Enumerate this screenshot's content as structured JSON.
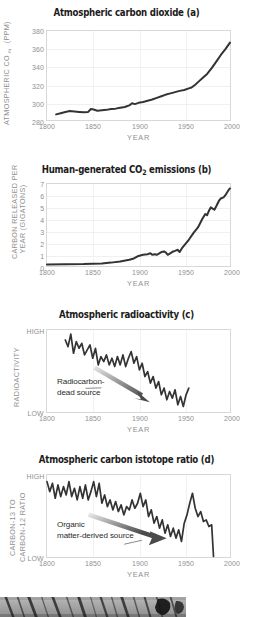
{
  "figure": {
    "xlabel": "YEAR",
    "xticks": [
      "1800",
      "1850",
      "1900",
      "1950",
      "2000"
    ]
  },
  "panels": {
    "a": {
      "title_prefix": "Atmospheric carbon dioxide",
      "title": "Atmospheric carbon dioxide (a)",
      "panel_letter": "(a)",
      "ylabel": "ATMOSPHERIC CO",
      "ylabel_sub": "2",
      "ylabel_suffix": " (PPM)",
      "ylabel_full": "ATMOSPHERIC CO2 (PPM)",
      "yticks": [
        "380",
        "360",
        "340",
        "320",
        "300",
        "280"
      ]
    },
    "b": {
      "title": "Human-generated CO2 emissions (b)",
      "title_part1": "Human-generated CO",
      "title_sub": "2",
      "title_part2": " emissions (b)",
      "panel_letter": "(b)",
      "ylabel_line1": "CARBON RELEASED PER",
      "ylabel_line2": "YEAR (GIGATONS)",
      "yticks": [
        "7",
        "6",
        "5",
        "4",
        "3",
        "2",
        "1",
        "0"
      ]
    },
    "c": {
      "title": "Atmospheric radioactivity (c)",
      "panel_letter": "(c)",
      "ylabel": "RADIOACTIVITY",
      "ytick_high": "HIGH",
      "ytick_low": "LOW",
      "annotation_line1": "Radiocarbon-",
      "annotation_line2": "dead source"
    },
    "d": {
      "title": "Atmospheric carbon istotope ratio (d)",
      "panel_letter": "(d)",
      "ylabel_line1": "CARBON-13 TO",
      "ylabel_line2": "CARBON-12 RATIO",
      "ytick_high": "HIGH",
      "ytick_low": "LOW",
      "annotation_line1": "Organic",
      "annotation_line2": "matter-derived source"
    }
  },
  "colors": {
    "series": "#333333",
    "title": "#1b1b1b",
    "tick": "#8f8f8f",
    "frame": "#d8d8d8",
    "grid": "#f0f0f0",
    "annotation": "#2b2b2b",
    "arrow_dark": "#4a4a4a",
    "arrow_light": "#dddddd"
  },
  "chart_data": [
    {
      "type": "line",
      "id": "a",
      "title": "Atmospheric carbon dioxide (a)",
      "xlabel": "YEAR",
      "ylabel": "ATMOSPHERIC CO2 (PPM)",
      "xlim": [
        1800,
        2000
      ],
      "ylim": [
        273,
        382
      ],
      "yticks": [
        280,
        300,
        320,
        340,
        360,
        380
      ],
      "xticks": [
        1800,
        1850,
        1900,
        1950,
        2000
      ],
      "grid": true,
      "x": [
        1810,
        1815,
        1820,
        1825,
        1830,
        1835,
        1840,
        1845,
        1848,
        1851,
        1855,
        1860,
        1865,
        1870,
        1875,
        1880,
        1885,
        1890,
        1893,
        1896,
        1900,
        1905,
        1910,
        1915,
        1920,
        1925,
        1930,
        1935,
        1940,
        1945,
        1950,
        1955,
        1958,
        1962,
        1966,
        1970,
        1975,
        1980,
        1985,
        1990,
        1995,
        2000
      ],
      "values": [
        281,
        282.5,
        284,
        285,
        284.5,
        284,
        283.5,
        284,
        287.5,
        287,
        285.5,
        286,
        286.5,
        287.5,
        288,
        289,
        290,
        292,
        294.5,
        293.5,
        295,
        296,
        297.5,
        299,
        301,
        303,
        305,
        306.5,
        308,
        309.5,
        310.5,
        312.5,
        313.5,
        317,
        321,
        325,
        330,
        337,
        345,
        353,
        360,
        368
      ]
    },
    {
      "type": "line",
      "id": "b",
      "title": "Human-generated CO2 emissions (b)",
      "xlabel": "YEAR",
      "ylabel": "CARBON RELEASED PER YEAR (GIGATONS)",
      "xlim": [
        1800,
        2000
      ],
      "ylim": [
        -0.15,
        7.3
      ],
      "yticks": [
        0,
        1,
        2,
        3,
        4,
        5,
        6,
        7
      ],
      "xticks": [
        1800,
        1850,
        1900,
        1950,
        2000
      ],
      "grid": true,
      "x": [
        1800,
        1820,
        1840,
        1860,
        1870,
        1880,
        1890,
        1895,
        1900,
        1905,
        1910,
        1913,
        1915,
        1918,
        1920,
        1925,
        1928,
        1930,
        1932,
        1935,
        1938,
        1940,
        1943,
        1945,
        1948,
        1950,
        1955,
        1960,
        1965,
        1970,
        1973,
        1975,
        1977,
        1979,
        1981,
        1983,
        1985,
        1988,
        1990,
        1993,
        1995,
        1998,
        2000
      ],
      "values": [
        0.08,
        0.1,
        0.12,
        0.18,
        0.25,
        0.35,
        0.5,
        0.62,
        0.85,
        0.95,
        1.0,
        1.1,
        0.95,
        1.0,
        0.95,
        1.2,
        1.25,
        1.15,
        0.95,
        1.1,
        1.25,
        1.3,
        1.4,
        1.2,
        1.6,
        1.8,
        2.3,
        2.9,
        3.4,
        4.2,
        4.6,
        4.5,
        4.9,
        5.2,
        5.1,
        5.0,
        5.3,
        5.8,
        6.0,
        6.1,
        6.3,
        6.7,
        6.9
      ]
    },
    {
      "type": "line",
      "id": "c",
      "title": "Atmospheric radioactivity (c)",
      "xlabel": "YEAR",
      "ylabel": "RADIOACTIVITY",
      "xlim": [
        1800,
        2000
      ],
      "ylim": [
        0,
        1
      ],
      "yticks_labels": [
        "LOW",
        "HIGH"
      ],
      "xticks": [
        1800,
        1850,
        1900,
        1950,
        2000
      ],
      "grid": true,
      "note": "noisy declining series from ~1820 to ~1955",
      "x": [
        1820,
        1823,
        1826,
        1829,
        1832,
        1835,
        1838,
        1841,
        1844,
        1847,
        1850,
        1853,
        1856,
        1859,
        1862,
        1865,
        1868,
        1871,
        1874,
        1877,
        1880,
        1883,
        1886,
        1889,
        1892,
        1895,
        1898,
        1901,
        1904,
        1907,
        1910,
        1913,
        1916,
        1919,
        1922,
        1925,
        1928,
        1931,
        1934,
        1937,
        1940,
        1943,
        1946,
        1949,
        1952,
        1955
      ],
      "values": [
        0.88,
        0.8,
        0.95,
        0.72,
        0.86,
        0.78,
        0.84,
        0.7,
        0.76,
        0.82,
        0.66,
        0.78,
        0.58,
        0.68,
        0.62,
        0.7,
        0.58,
        0.66,
        0.56,
        0.68,
        0.58,
        0.7,
        0.56,
        0.66,
        0.74,
        0.6,
        0.68,
        0.52,
        0.6,
        0.44,
        0.5,
        0.36,
        0.44,
        0.3,
        0.38,
        0.22,
        0.3,
        0.16,
        0.26,
        0.18,
        0.28,
        0.1,
        0.2,
        0.08,
        0.22,
        0.3
      ]
    },
    {
      "type": "line",
      "id": "d",
      "title": "Atmospheric carbon istotope ratio (d)",
      "xlabel": "YEAR",
      "ylabel": "CARBON-13 TO CARBON-12 RATIO",
      "xlim": [
        1800,
        2000
      ],
      "ylim": [
        0,
        1
      ],
      "yticks_labels": [
        "LOW",
        "HIGH"
      ],
      "xticks": [
        1800,
        1850,
        1900,
        1950,
        2000
      ],
      "grid": true,
      "note": "noisy declining series from 1800 to ~1982 ending in sharp drop",
      "x": [
        1800,
        1803,
        1806,
        1809,
        1812,
        1815,
        1818,
        1821,
        1824,
        1827,
        1830,
        1833,
        1836,
        1839,
        1842,
        1845,
        1848,
        1851,
        1854,
        1857,
        1860,
        1863,
        1866,
        1869,
        1872,
        1875,
        1878,
        1881,
        1884,
        1887,
        1890,
        1893,
        1896,
        1899,
        1902,
        1905,
        1908,
        1911,
        1914,
        1917,
        1920,
        1923,
        1926,
        1929,
        1932,
        1935,
        1938,
        1941,
        1944,
        1947,
        1950,
        1953,
        1956,
        1959,
        1962,
        1965,
        1968,
        1971,
        1974,
        1977,
        1980,
        1982
      ],
      "values": [
        0.92,
        0.8,
        0.9,
        0.72,
        0.88,
        0.74,
        0.86,
        0.76,
        0.92,
        0.74,
        0.84,
        0.7,
        0.86,
        0.72,
        0.88,
        0.7,
        0.8,
        0.92,
        0.74,
        0.9,
        0.66,
        0.76,
        0.62,
        0.7,
        0.58,
        0.68,
        0.56,
        0.64,
        0.52,
        0.62,
        0.58,
        0.7,
        0.6,
        0.66,
        0.78,
        0.62,
        0.7,
        0.5,
        0.58,
        0.42,
        0.5,
        0.36,
        0.46,
        0.3,
        0.4,
        0.26,
        0.36,
        0.24,
        0.34,
        0.2,
        0.42,
        0.52,
        0.66,
        0.78,
        0.6,
        0.5,
        0.56,
        0.44,
        0.46,
        0.38,
        0.4,
        0.02
      ]
    }
  ],
  "photo": {
    "caption": "",
    "description": "tree-ring core sample photograph"
  }
}
